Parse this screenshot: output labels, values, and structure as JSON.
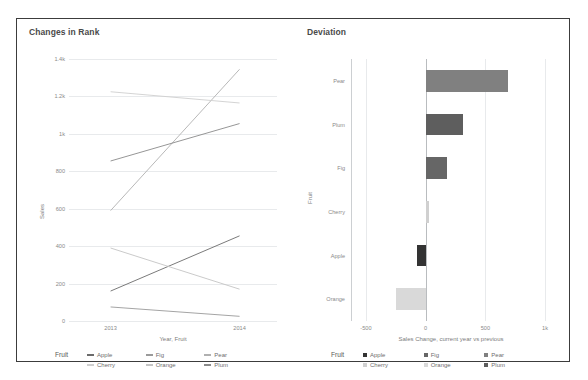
{
  "dashboard": {
    "panels": [
      {
        "title": "Changes in Rank"
      },
      {
        "title": "Deviation"
      }
    ]
  },
  "line_panel": {
    "title": "Changes in Rank",
    "y_axis_title": "Sales",
    "x_axis_title": "Year, Fruit",
    "y_ticks": [
      "1.4k",
      "1.2k",
      "1k",
      "800",
      "600",
      "400",
      "200",
      "0"
    ],
    "x_ticks": [
      "2013",
      "2014"
    ],
    "legend": {
      "title": "Fruit",
      "items": [
        {
          "label": "Apple",
          "color": "#6b6b6b"
        },
        {
          "label": "Fig",
          "color": "#9a9a9a"
        },
        {
          "label": "Pear",
          "color": "#b0b0b0"
        },
        {
          "label": "Cherry",
          "color": "#cfcfcf"
        },
        {
          "label": "Orange",
          "color": "#c4c4c4"
        },
        {
          "label": "Plum",
          "color": "#8a8a8a"
        }
      ]
    }
  },
  "bar_panel": {
    "title": "Deviation",
    "y_axis_title": "Fruit",
    "x_axis_title": "Sales Change, current year vs previous",
    "x_ticks": [
      "-500",
      "0",
      "500",
      "1k"
    ],
    "legend": {
      "title": "Fruit",
      "items": [
        {
          "label": "Apple",
          "color": "#333333"
        },
        {
          "label": "Fig",
          "color": "#666666"
        },
        {
          "label": "Pear",
          "color": "#808080"
        },
        {
          "label": "Cherry",
          "color": "#d0d0d0"
        },
        {
          "label": "Orange",
          "color": "#d9d9d9"
        },
        {
          "label": "Plum",
          "color": "#5e5e5e"
        }
      ]
    }
  },
  "chart_data": [
    {
      "type": "line",
      "title": "Changes in Rank",
      "xlabel": "Year, Fruit",
      "ylabel": "Sales",
      "x": [
        "2013",
        "2014"
      ],
      "ylim": [
        0,
        1400
      ],
      "yticks": [
        0,
        200,
        400,
        600,
        800,
        1000,
        1200,
        1400
      ],
      "ytick_labels": [
        "0",
        "200",
        "400",
        "600",
        "800",
        "1k",
        "1.2k",
        "1.4k"
      ],
      "grid": true,
      "legend": "bottom",
      "series": [
        {
          "name": "Pear",
          "values": [
            590,
            1345
          ],
          "color": "#b0b0b0"
        },
        {
          "name": "Plum",
          "values": [
            855,
            1055
          ],
          "color": "#8a8a8a"
        },
        {
          "name": "Cherry",
          "values": [
            1225,
            1165
          ],
          "color": "#cfcfcf"
        },
        {
          "name": "Apple",
          "values": [
            160,
            455
          ],
          "color": "#6b6b6b"
        },
        {
          "name": "Orange",
          "values": [
            390,
            170
          ],
          "color": "#c4c4c4"
        },
        {
          "name": "Fig",
          "values": [
            75,
            25
          ],
          "color": "#9a9a9a"
        }
      ]
    },
    {
      "type": "bar",
      "orientation": "horizontal",
      "title": "Deviation",
      "xlabel": "Sales Change, current year vs previous",
      "ylabel": "Fruit",
      "categories": [
        "Pear",
        "Plum",
        "Fig",
        "Cherry",
        "Apple",
        "Orange"
      ],
      "values": [
        690,
        310,
        180,
        30,
        -75,
        -250
      ],
      "colors": [
        "#808080",
        "#5e5e5e",
        "#666666",
        "#d0d0d0",
        "#333333",
        "#d9d9d9"
      ],
      "xlim": [
        -625,
        1050
      ],
      "xticks": [
        -500,
        0,
        500,
        1000
      ],
      "xtick_labels": [
        "-500",
        "0",
        "500",
        "1k"
      ],
      "grid": true,
      "legend": "bottom"
    }
  ]
}
